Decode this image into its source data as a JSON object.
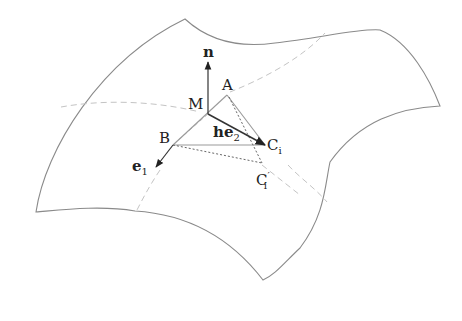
{
  "diagram": {
    "labels": {
      "n": "n",
      "M": "M",
      "A": "A",
      "B": "B",
      "he2_h": "h",
      "he2_e": "e",
      "he2_sub": "2",
      "Ci_C": "C",
      "Ci_sub": "i",
      "Cpi_C": "C",
      "Cpi_prime": "′",
      "Cpi_sub": "i",
      "e1_e": "e",
      "e1_sub": "1"
    },
    "colors": {
      "surface_outline": "#8a8a8a",
      "dashed_curves": "#c4c4c4",
      "vectors": "#333333",
      "triangle": "#9a9a9a",
      "dotted": "#666666"
    }
  }
}
